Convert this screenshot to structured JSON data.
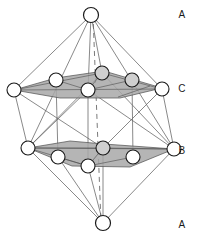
{
  "figure": {
    "background_color": "#ffffff",
    "atom_fill": "#ffffff",
    "atom_stroke": "#1a1a1a",
    "bond_color": "#6b6b6b",
    "plane_fill": "#a8a8a8",
    "plane_stroke": "#4d4d4d",
    "axis_color": "#8a8a8a",
    "label_color": "#1a1a1a"
  },
  "labels": {
    "top_apex": "A",
    "upper_plane": "C",
    "lower_plane": "B",
    "bottom_apex": "A"
  },
  "label_positions": {
    "top_apex": {
      "x": 182,
      "y": 18
    },
    "upper_plane": {
      "x": 182,
      "y": 92
    },
    "lower_plane": {
      "x": 182,
      "y": 154
    },
    "bottom_apex": {
      "x": 182,
      "y": 228
    }
  },
  "atoms": {
    "radius": 7,
    "top_apex": {
      "id": "A-top",
      "x": 91,
      "y": 15,
      "layer": "A"
    },
    "bottom_apex": {
      "id": "A-bottom",
      "x": 103,
      "y": 223,
      "layer": "A"
    },
    "upper_plane_C": [
      {
        "id": "C1",
        "x": 14,
        "y": 90,
        "layer": "C"
      },
      {
        "id": "C2",
        "x": 56,
        "y": 80,
        "layer": "C"
      },
      {
        "id": "C3",
        "x": 102,
        "y": 73,
        "layer": "C"
      },
      {
        "id": "C4",
        "x": 132,
        "y": 80,
        "layer": "C"
      },
      {
        "id": "C5",
        "x": 162,
        "y": 89,
        "layer": "C"
      },
      {
        "id": "C6",
        "x": 88,
        "y": 90,
        "layer": "C"
      }
    ],
    "lower_plane_B": [
      {
        "id": "B1",
        "x": 28,
        "y": 148,
        "layer": "B"
      },
      {
        "id": "B2",
        "x": 58,
        "y": 157,
        "layer": "B"
      },
      {
        "id": "B3",
        "x": 103,
        "y": 148,
        "layer": "B"
      },
      {
        "id": "B4",
        "x": 133,
        "y": 157,
        "layer": "B"
      },
      {
        "id": "B5",
        "x": 174,
        "y": 149,
        "layer": "B"
      },
      {
        "id": "B6",
        "x": 88,
        "y": 166,
        "layer": "B"
      }
    ]
  },
  "planes": {
    "upper_C": [
      {
        "x": 14,
        "y": 90
      },
      {
        "x": 56,
        "y": 78
      },
      {
        "x": 104,
        "y": 71
      },
      {
        "x": 162,
        "y": 88
      },
      {
        "x": 120,
        "y": 98
      },
      {
        "x": 60,
        "y": 98
      }
    ],
    "lower_B": [
      {
        "x": 28,
        "y": 148
      },
      {
        "x": 70,
        "y": 141
      },
      {
        "x": 104,
        "y": 144
      },
      {
        "x": 174,
        "y": 149
      },
      {
        "x": 130,
        "y": 167
      },
      {
        "x": 72,
        "y": 166
      }
    ]
  },
  "axis": {
    "label": "c-axis",
    "style": "dashed",
    "top": {
      "x": 93,
      "y": 15
    },
    "bottom": {
      "x": 101,
      "y": 223
    }
  },
  "bond_groups": {
    "top_apex_to_C": [
      "C1",
      "C2",
      "C3",
      "C4",
      "C5",
      "C6"
    ],
    "bottom_apex_to_B": [
      "B1",
      "B2",
      "B3",
      "B4",
      "B5",
      "B6"
    ],
    "C_to_B_edges": [
      [
        "C1",
        "B1"
      ],
      [
        "C5",
        "B5"
      ],
      [
        "C1",
        "B3"
      ],
      [
        "C5",
        "B3"
      ],
      [
        "C3",
        "B1"
      ],
      [
        "C3",
        "B5"
      ],
      [
        "C6",
        "B1"
      ],
      [
        "C6",
        "B5"
      ]
    ]
  }
}
